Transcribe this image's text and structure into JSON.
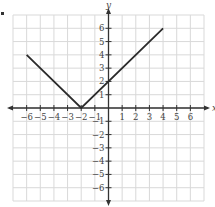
{
  "chart_data": {
    "type": "line",
    "title": "",
    "xlabel": "x",
    "ylabel": "y",
    "xlim": [
      -7,
      7
    ],
    "ylim": [
      -7,
      7
    ],
    "grid": true,
    "x_ticks": [
      -6,
      -5,
      -4,
      -3,
      -2,
      -1,
      1,
      2,
      3,
      4,
      5,
      6
    ],
    "y_ticks": [
      -6,
      -5,
      -4,
      -3,
      -2,
      -1,
      1,
      2,
      3,
      4,
      5,
      6
    ],
    "x_tick_labels": [
      "−6",
      "−5",
      "−4",
      "−3",
      "−2",
      "−1",
      "1",
      "2",
      "3",
      "4",
      "5",
      "6"
    ],
    "y_tick_labels": [
      "−6",
      "−5",
      "−4",
      "−3",
      "−2",
      "−1",
      "1",
      "2",
      "3",
      "4",
      "5",
      "6"
    ],
    "series": [
      {
        "name": "y = |x + 2|",
        "x": [
          -6,
          -2,
          4
        ],
        "y": [
          4,
          0,
          6
        ]
      }
    ],
    "annotations": [],
    "legend": "none"
  },
  "colors": {
    "grid": "#d9d9d9",
    "axis": "#333333",
    "line": "#2b2b2b",
    "text": "#444444"
  }
}
